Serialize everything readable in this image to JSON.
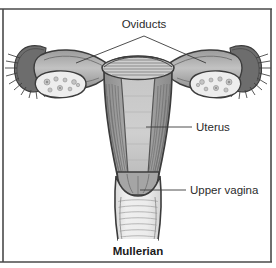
{
  "figure": {
    "caption": "Mullerian",
    "title_alt": "Mullerian",
    "background_color": "#ffffff",
    "frame_color": "#4a4a4a",
    "label_color": "#2b2b2b"
  },
  "labels": {
    "oviducts": "Oviducts",
    "uterus": "Uterus",
    "upper_vagina": "Upper vagina"
  },
  "anatomy": {
    "palette": {
      "outline": "#3c3c3c",
      "myometrium": "#9e9e9e",
      "myometrium_dark": "#777777",
      "cavity": "#c9c9c9",
      "cavity_light": "#d6d6d6",
      "ovary_fill": "#ededed",
      "follicle": "#bdbdbd",
      "fimbriae": "#5e5e5e",
      "vagina_fill": "#e8e8e8",
      "vagina_wall": "#9a9a9a",
      "serosa": "#8a8a8a"
    },
    "parts": [
      {
        "name": "left-fimbriae",
        "label": "Fimbriae (left)"
      },
      {
        "name": "right-fimbriae",
        "label": "Fimbriae (right)"
      },
      {
        "name": "left-oviduct",
        "label": "Oviduct (left)"
      },
      {
        "name": "right-oviduct",
        "label": "Oviduct (right)"
      },
      {
        "name": "left-ovary",
        "label": "Ovary (left)"
      },
      {
        "name": "right-ovary",
        "label": "Ovary (right)"
      },
      {
        "name": "uterine-fundus",
        "label": "Uterine fundus"
      },
      {
        "name": "uterine-cavity",
        "label": "Uterine cavity"
      },
      {
        "name": "myometrium",
        "label": "Myometrium"
      },
      {
        "name": "cervix",
        "label": "Cervix"
      },
      {
        "name": "upper-vagina",
        "label": "Upper vagina"
      }
    ]
  }
}
